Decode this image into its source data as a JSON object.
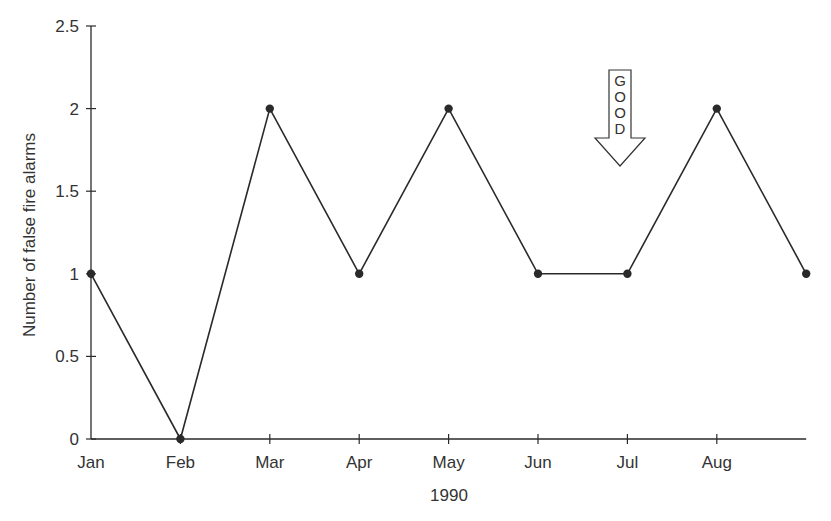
{
  "chart_data": {
    "type": "line",
    "title": "",
    "xlabel": "1990",
    "ylabel": "Number of false fire alarms",
    "categories": [
      "Jan",
      "Feb",
      "Mar",
      "Apr",
      "May",
      "Jun",
      "Jul",
      "Aug",
      ""
    ],
    "series": [
      {
        "name": "False fire alarms",
        "values": [
          1,
          0,
          2,
          1,
          2,
          1,
          1,
          2,
          1
        ],
        "color": "#2a2a2a",
        "marker": "circle"
      }
    ],
    "ylim": [
      0,
      2.5
    ],
    "yticks": [
      0,
      0.5,
      1,
      1.5,
      2,
      2.5
    ],
    "ytick_labels": [
      "0",
      "0.5",
      "1",
      "1.5",
      "2",
      "2.5"
    ],
    "grid": false,
    "legend": null,
    "annotations": [
      {
        "type": "arrow-down",
        "text": "GOOD",
        "letters": [
          "G",
          "O",
          "O",
          "D"
        ],
        "near_category": "Jul",
        "y_top": 2.23,
        "y_bottom": 1.65
      }
    ]
  }
}
